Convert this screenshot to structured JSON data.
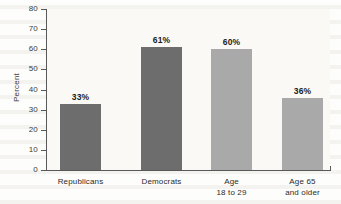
{
  "chart_data": {
    "type": "bar",
    "title": "",
    "subtitle": "",
    "xlabel": "",
    "ylabel": "Percent",
    "ylim": [
      0,
      80
    ],
    "ytick_step": 10,
    "grid": false,
    "legend": "none",
    "categories": [
      "Republicans",
      "Democrats",
      "Age 18 to 29",
      "Age 65 and older"
    ],
    "category_lines": [
      [
        "Republicans"
      ],
      [
        "Democrats"
      ],
      [
        "Age",
        "18 to 29"
      ],
      [
        "Age 65",
        "and older"
      ]
    ],
    "values": [
      33,
      61,
      60,
      36
    ],
    "data_labels": [
      "33%",
      "61%",
      "60%",
      "36%"
    ],
    "bar_colors": [
      "#6d6d6d",
      "#6d6d6d",
      "#a9a9a9",
      "#a9a9a9"
    ],
    "ytick_labels": [
      "80",
      "70",
      "60",
      "50",
      "40",
      "30",
      "20",
      "10",
      "0"
    ],
    "ytick_values": [
      80,
      70,
      60,
      50,
      40,
      30,
      20,
      10,
      0
    ]
  },
  "axis": {
    "y_title": "Percent"
  },
  "colors": {
    "dark_bar": "#6d6d6d",
    "light_bar": "#a9a9a9",
    "axis": "#59595a",
    "text": "#2b2b2b",
    "plot_background": "#faf9f6"
  }
}
